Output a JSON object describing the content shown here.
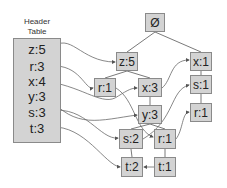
{
  "header_table": {
    "title_line1": "Header",
    "title_line2": "Table",
    "rows": [
      {
        "item": "z",
        "count": 5,
        "label": "z:5"
      },
      {
        "item": "r",
        "count": 3,
        "label": "r:3"
      },
      {
        "item": "x",
        "count": 4,
        "label": "x:4"
      },
      {
        "item": "y",
        "count": 3,
        "label": "y:3"
      },
      {
        "item": "s",
        "count": 3,
        "label": "s:3"
      },
      {
        "item": "t",
        "count": 3,
        "label": "t:3"
      }
    ]
  },
  "tree": {
    "root": {
      "label": "Ø"
    },
    "nodes": [
      {
        "id": "z5",
        "label": "z:5",
        "parent": "root"
      },
      {
        "id": "x1",
        "label": "x:1",
        "parent": "root"
      },
      {
        "id": "r1a",
        "label": "r:1",
        "parent": "z5"
      },
      {
        "id": "x3",
        "label": "x:3",
        "parent": "z5"
      },
      {
        "id": "s1",
        "label": "s:1",
        "parent": "x1"
      },
      {
        "id": "y3",
        "label": "y:3",
        "parent": "x3"
      },
      {
        "id": "r1c",
        "label": "r:1",
        "parent": "s1"
      },
      {
        "id": "s2",
        "label": "s:2",
        "parent": "y3"
      },
      {
        "id": "r1b",
        "label": "r:1",
        "parent": "y3"
      },
      {
        "id": "t2",
        "label": "t:2",
        "parent": "s2"
      },
      {
        "id": "t1",
        "label": "t:1",
        "parent": "r1b"
      }
    ]
  },
  "colors": {
    "node_fill": "#d3d3d3",
    "node_border": "#8a8a8a",
    "edge": "#7a7a7a",
    "link": "#6a6a6a"
  }
}
